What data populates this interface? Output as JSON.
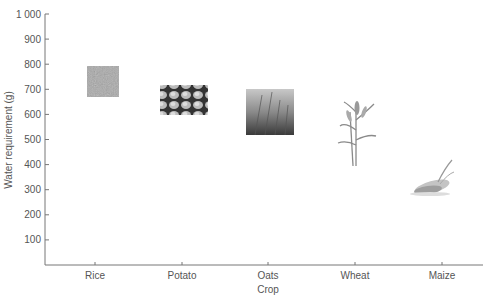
{
  "chart_data": {
    "type": "scatter",
    "title": "",
    "xlabel": "Crop",
    "ylabel": "Water requirement (g)",
    "categories": [
      "Rice",
      "Potato",
      "Oats",
      "Wheat",
      "Maize"
    ],
    "ylim": [
      0,
      1000
    ],
    "yticks": [
      100,
      200,
      300,
      400,
      500,
      600,
      700,
      800,
      900,
      1000
    ],
    "ytick_labels": [
      "100",
      "200",
      "300",
      "400",
      "500",
      "600",
      "700",
      "800",
      "900",
      "1 000"
    ],
    "grid": false,
    "legend": null,
    "marker_style": "pictogram images of each crop",
    "values": [
      730,
      655,
      610,
      520,
      360
    ],
    "ranges": [
      {
        "crop": "Rice",
        "low": 670,
        "high": 795,
        "image": "rice-grains-photo"
      },
      {
        "crop": "Potato",
        "low": 600,
        "high": 715,
        "image": "potatoes-photo"
      },
      {
        "crop": "Oats",
        "low": 520,
        "high": 700,
        "image": "oats-field-photo"
      },
      {
        "crop": "Wheat",
        "low": 395,
        "high": 650,
        "image": "wheat-plant-drawing"
      },
      {
        "crop": "Maize",
        "low": 280,
        "high": 440,
        "image": "maize-cob-drawing"
      }
    ]
  },
  "axes": {
    "x_title": "Crop",
    "y_title": "Water requirement (g)"
  }
}
